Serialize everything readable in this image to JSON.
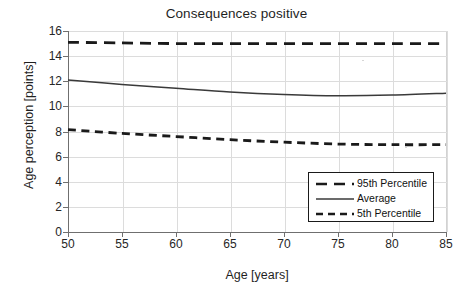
{
  "chart_data": {
    "type": "line",
    "title": "Consequences positive",
    "xlabel": "Age [years]",
    "ylabel": "Age perception [points]",
    "xlim": [
      50,
      85
    ],
    "ylim": [
      0,
      16
    ],
    "xticks": [
      50,
      55,
      60,
      65,
      70,
      75,
      80,
      85
    ],
    "yticks": [
      0,
      2,
      4,
      6,
      8,
      10,
      12,
      14,
      16
    ],
    "grid": true,
    "legend_position": "lower right",
    "x": [
      50,
      55,
      60,
      65,
      70,
      75,
      80,
      85
    ],
    "series": [
      {
        "name": "95th Percentile",
        "style": "dashed-long",
        "color": "#1a1a1a",
        "values": [
          15.1,
          15.05,
          15.0,
          15.0,
          15.0,
          15.0,
          15.0,
          15.0
        ]
      },
      {
        "name": "Average",
        "style": "solid",
        "color": "#3a3a3a",
        "values": [
          12.1,
          11.75,
          11.45,
          11.15,
          10.95,
          10.85,
          10.9,
          11.05
        ]
      },
      {
        "name": "5th Percentile",
        "style": "dashed-short",
        "color": "#1a1a1a",
        "values": [
          8.15,
          7.85,
          7.6,
          7.35,
          7.15,
          7.0,
          6.95,
          6.95
        ]
      }
    ]
  },
  "legend": {
    "entries": [
      {
        "label": "95th Percentile"
      },
      {
        "label": "Average"
      },
      {
        "label": "5th Percentile"
      }
    ]
  },
  "colors": {
    "ink": "#1a1a1a",
    "axis": "#6f6f6f",
    "grid": "#dcdcdc",
    "background": "#ffffff"
  }
}
